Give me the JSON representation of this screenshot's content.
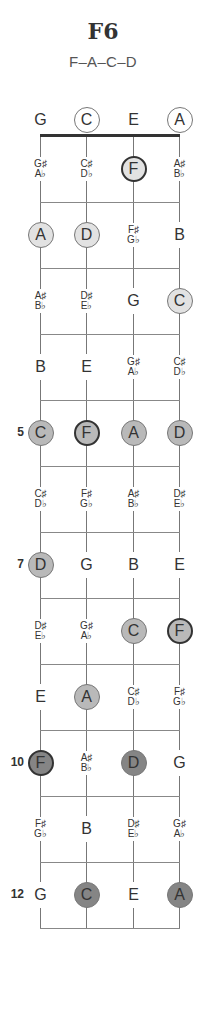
{
  "chord": {
    "name": "F6",
    "notes_label": "F–A–C–D"
  },
  "layout": {
    "string_x": [
      40,
      86,
      133,
      179
    ],
    "nut_y": 136,
    "fret_spacing": 66,
    "fret_count": 12,
    "open_row_y": 120
  },
  "colors": {
    "fret_1_4": "#e2e2e2",
    "fret_5_9": "#b9b9b9",
    "fret_10_12": "#858585",
    "root_border": "#333333"
  },
  "fret_markers": [
    {
      "fret": 5,
      "label": "5"
    },
    {
      "fret": 7,
      "label": "7"
    },
    {
      "fret": 10,
      "label": "10"
    },
    {
      "fret": 12,
      "label": "12"
    }
  ],
  "rows": [
    {
      "fret": 0,
      "cells": [
        {
          "top": "G"
        },
        {
          "top": "C",
          "chord": true
        },
        {
          "top": "E"
        },
        {
          "top": "A",
          "chord": true
        }
      ]
    },
    {
      "fret": 1,
      "cells": [
        {
          "top": "G♯",
          "bottom": "A♭"
        },
        {
          "top": "C♯",
          "bottom": "D♭"
        },
        {
          "top": "F",
          "chord": true,
          "root": true
        },
        {
          "top": "A♯",
          "bottom": "B♭"
        }
      ]
    },
    {
      "fret": 2,
      "cells": [
        {
          "top": "A",
          "chord": true
        },
        {
          "top": "D",
          "chord": true
        },
        {
          "top": "F♯",
          "bottom": "G♭"
        },
        {
          "top": "B"
        }
      ]
    },
    {
      "fret": 3,
      "cells": [
        {
          "top": "A♯",
          "bottom": "B♭"
        },
        {
          "top": "D♯",
          "bottom": "E♭"
        },
        {
          "top": "G"
        },
        {
          "top": "C",
          "chord": true
        }
      ]
    },
    {
      "fret": 4,
      "cells": [
        {
          "top": "B"
        },
        {
          "top": "E"
        },
        {
          "top": "G♯",
          "bottom": "A♭"
        },
        {
          "top": "C♯",
          "bottom": "D♭"
        }
      ]
    },
    {
      "fret": 5,
      "cells": [
        {
          "top": "C",
          "chord": true
        },
        {
          "top": "F",
          "chord": true,
          "root": true
        },
        {
          "top": "A",
          "chord": true
        },
        {
          "top": "D",
          "chord": true
        }
      ]
    },
    {
      "fret": 6,
      "cells": [
        {
          "top": "C♯",
          "bottom": "D♭"
        },
        {
          "top": "F♯",
          "bottom": "G♭"
        },
        {
          "top": "A♯",
          "bottom": "B♭"
        },
        {
          "top": "D♯",
          "bottom": "E♭"
        }
      ]
    },
    {
      "fret": 7,
      "cells": [
        {
          "top": "D",
          "chord": true
        },
        {
          "top": "G"
        },
        {
          "top": "B"
        },
        {
          "top": "E"
        }
      ]
    },
    {
      "fret": 8,
      "cells": [
        {
          "top": "D♯",
          "bottom": "E♭"
        },
        {
          "top": "G♯",
          "bottom": "A♭"
        },
        {
          "top": "C",
          "chord": true
        },
        {
          "top": "F",
          "chord": true,
          "root": true
        }
      ]
    },
    {
      "fret": 9,
      "cells": [
        {
          "top": "E"
        },
        {
          "top": "A",
          "chord": true
        },
        {
          "top": "C♯",
          "bottom": "D♭"
        },
        {
          "top": "F♯",
          "bottom": "G♭"
        }
      ]
    },
    {
      "fret": 10,
      "cells": [
        {
          "top": "F",
          "chord": true,
          "root": true
        },
        {
          "top": "A♯",
          "bottom": "B♭"
        },
        {
          "top": "D",
          "chord": true
        },
        {
          "top": "G"
        }
      ]
    },
    {
      "fret": 11,
      "cells": [
        {
          "top": "F♯",
          "bottom": "G♭"
        },
        {
          "top": "B"
        },
        {
          "top": "D♯",
          "bottom": "E♭"
        },
        {
          "top": "G♯",
          "bottom": "A♭"
        }
      ]
    },
    {
      "fret": 12,
      "cells": [
        {
          "top": "G"
        },
        {
          "top": "C",
          "chord": true
        },
        {
          "top": "E"
        },
        {
          "top": "A",
          "chord": true
        }
      ]
    }
  ]
}
